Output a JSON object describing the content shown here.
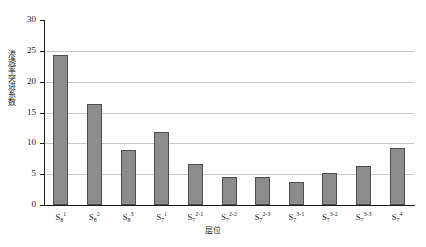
{
  "chart_data": {
    "type": "bar",
    "title": "",
    "xlabel": "层位",
    "ylabel": "渗透率突进系数",
    "ylim": [
      0,
      30
    ],
    "yticks": [
      0,
      5,
      10,
      15,
      20,
      25,
      30
    ],
    "grid": "horizontal",
    "legend": "none",
    "bar_color": "#8c8c8c",
    "bar_border_color": "#4d4d4d",
    "gridline_color": "#c8c8c8",
    "axis_color": "#1a1a1a",
    "categories": [
      "S8-1",
      "S8-2",
      "S8-3",
      "S7-1",
      "S7-2-1",
      "S7-2-2",
      "S7-2-3",
      "S7-3-1",
      "S7-3-2",
      "S7-3-3",
      "S7-4"
    ],
    "category_labels": [
      {
        "base": "S",
        "sub": "8",
        "sup": "1"
      },
      {
        "base": "S",
        "sub": "8",
        "sup": "2"
      },
      {
        "base": "S",
        "sub": "8",
        "sup": "3"
      },
      {
        "base": "S",
        "sub": "7",
        "sup": "1"
      },
      {
        "base": "S",
        "sub": "7",
        "sup": "2-1"
      },
      {
        "base": "S",
        "sub": "7",
        "sup": "2-2"
      },
      {
        "base": "S",
        "sub": "7",
        "sup": "2-3"
      },
      {
        "base": "S",
        "sub": "7",
        "sup": "3-1"
      },
      {
        "base": "S",
        "sub": "7",
        "sup": "3-2"
      },
      {
        "base": "S",
        "sub": "7",
        "sup": "3-3"
      },
      {
        "base": "S",
        "sub": "7",
        "sup": "4"
      }
    ],
    "values": [
      24.4,
      16.3,
      8.9,
      11.9,
      6.7,
      4.5,
      4.5,
      3.8,
      5.2,
      6.3,
      9.3
    ]
  }
}
